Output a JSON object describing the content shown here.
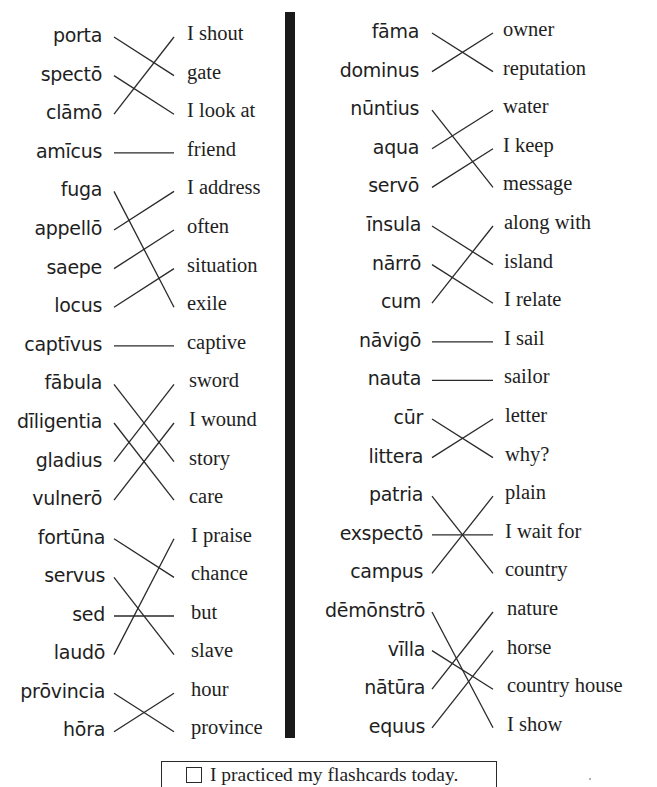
{
  "worksheet": {
    "left_column": {
      "latin": [
        "porta",
        "spectō",
        "clāmō",
        "amīcus",
        "fuga",
        "appellō",
        "saepe",
        "locus",
        "captīvus",
        "fābula",
        "dīligentia",
        "gladius",
        "vulnerō",
        "fortūna",
        "servus",
        "sed",
        "laudō",
        "prōvincia",
        "hōra"
      ],
      "english": [
        "I shout",
        "gate",
        "I look at",
        "friend",
        "I address",
        "often",
        "situation",
        "exile",
        "captive",
        "sword",
        "I wound",
        "story",
        "care",
        "I praise",
        "chance",
        "but",
        "slave",
        "hour",
        "province"
      ],
      "matches": [
        [
          0,
          1
        ],
        [
          1,
          2
        ],
        [
          2,
          0
        ],
        [
          3,
          3
        ],
        [
          4,
          7
        ],
        [
          5,
          4
        ],
        [
          6,
          5
        ],
        [
          7,
          6
        ],
        [
          8,
          8
        ],
        [
          9,
          11
        ],
        [
          10,
          12
        ],
        [
          11,
          9
        ],
        [
          12,
          10
        ],
        [
          13,
          14
        ],
        [
          14,
          16
        ],
        [
          15,
          15
        ],
        [
          16,
          13
        ],
        [
          17,
          18
        ],
        [
          18,
          17
        ]
      ]
    },
    "right_column": {
      "latin": [
        "fāma",
        "dominus",
        "nūntius",
        "aqua",
        "servō",
        "īnsula",
        "nārrō",
        "cum",
        "nāvigō",
        "nauta",
        "cūr",
        "littera",
        "patria",
        "exspectō",
        "campus",
        "dēmōnstrō",
        "vīlla",
        "nātūra",
        "equus"
      ],
      "english": [
        "owner",
        "reputation",
        "water",
        "I keep",
        "message",
        "along with",
        "island",
        "I relate",
        "I sail",
        "sailor",
        "letter",
        "why?",
        "plain",
        "I wait for",
        "country",
        "nature",
        "horse",
        "country house",
        "I show"
      ],
      "matches": [
        [
          0,
          1
        ],
        [
          1,
          0
        ],
        [
          2,
          4
        ],
        [
          3,
          2
        ],
        [
          4,
          3
        ],
        [
          5,
          6
        ],
        [
          6,
          7
        ],
        [
          7,
          5
        ],
        [
          8,
          8
        ],
        [
          9,
          9
        ],
        [
          10,
          11
        ],
        [
          11,
          10
        ],
        [
          12,
          14
        ],
        [
          13,
          13
        ],
        [
          14,
          12
        ],
        [
          15,
          18
        ],
        [
          16,
          17
        ],
        [
          17,
          15
        ],
        [
          18,
          16
        ]
      ]
    }
  },
  "footer": {
    "checkbox_checked": false,
    "label": "I practiced my flashcards today."
  }
}
